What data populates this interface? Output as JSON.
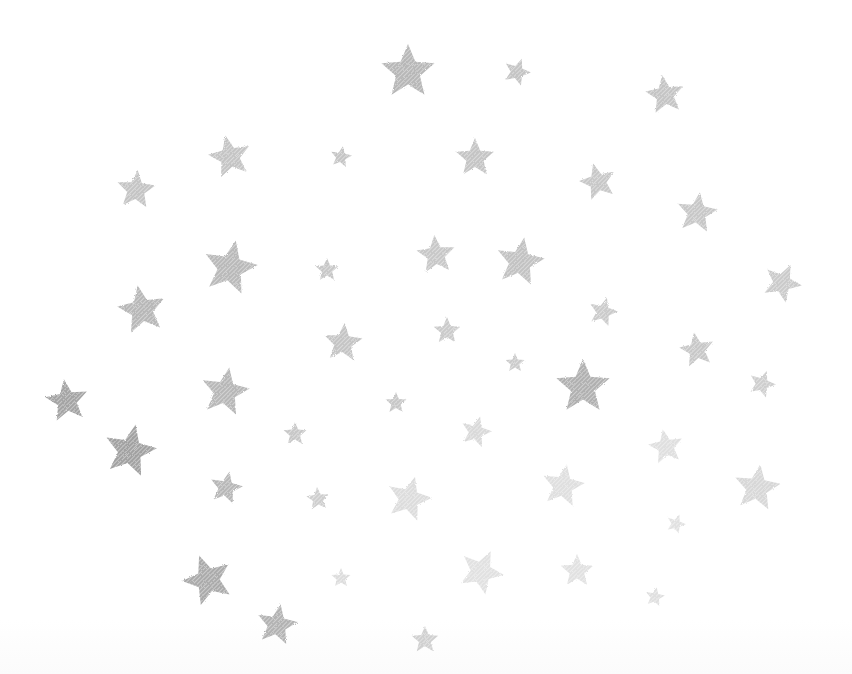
{
  "scene": {
    "description": "Scattered textured gray stars on a white background",
    "background_color": "#ffffff",
    "star_color": "#8a8a8a",
    "width": 852,
    "height": 674
  },
  "stars": [
    {
      "x": 408,
      "y": 72,
      "r": 28,
      "rot": 0,
      "opacity": 0.62
    },
    {
      "x": 517,
      "y": 72,
      "r": 14,
      "rot": 20,
      "opacity": 0.5
    },
    {
      "x": 665,
      "y": 95,
      "r": 20,
      "rot": -8,
      "opacity": 0.5
    },
    {
      "x": 230,
      "y": 157,
      "r": 22,
      "rot": -12,
      "opacity": 0.5
    },
    {
      "x": 341,
      "y": 157,
      "r": 11,
      "rot": 10,
      "opacity": 0.5
    },
    {
      "x": 475,
      "y": 158,
      "r": 20,
      "rot": 0,
      "opacity": 0.5
    },
    {
      "x": 136,
      "y": 190,
      "r": 20,
      "rot": 5,
      "opacity": 0.5
    },
    {
      "x": 598,
      "y": 182,
      "r": 19,
      "rot": -15,
      "opacity": 0.48
    },
    {
      "x": 697,
      "y": 213,
      "r": 21,
      "rot": 8,
      "opacity": 0.48
    },
    {
      "x": 230,
      "y": 268,
      "r": 28,
      "rot": 12,
      "opacity": 0.6
    },
    {
      "x": 327,
      "y": 270,
      "r": 12,
      "rot": 0,
      "opacity": 0.48
    },
    {
      "x": 436,
      "y": 255,
      "r": 20,
      "rot": -5,
      "opacity": 0.48
    },
    {
      "x": 520,
      "y": 262,
      "r": 25,
      "rot": 10,
      "opacity": 0.52
    },
    {
      "x": 782,
      "y": 283,
      "r": 20,
      "rot": 25,
      "opacity": 0.45
    },
    {
      "x": 142,
      "y": 310,
      "r": 25,
      "rot": -10,
      "opacity": 0.62
    },
    {
      "x": 603,
      "y": 312,
      "r": 15,
      "rot": 15,
      "opacity": 0.45
    },
    {
      "x": 343,
      "y": 343,
      "r": 20,
      "rot": 5,
      "opacity": 0.5
    },
    {
      "x": 447,
      "y": 331,
      "r": 14,
      "rot": 0,
      "opacity": 0.45
    },
    {
      "x": 697,
      "y": 350,
      "r": 18,
      "rot": -10,
      "opacity": 0.48
    },
    {
      "x": 515,
      "y": 363,
      "r": 10,
      "rot": 0,
      "opacity": 0.45
    },
    {
      "x": 67,
      "y": 401,
      "r": 22,
      "rot": -8,
      "opacity": 0.78
    },
    {
      "x": 225,
      "y": 392,
      "r": 25,
      "rot": 10,
      "opacity": 0.62
    },
    {
      "x": 583,
      "y": 387,
      "r": 28,
      "rot": 0,
      "opacity": 0.68
    },
    {
      "x": 762,
      "y": 384,
      "r": 14,
      "rot": 20,
      "opacity": 0.42
    },
    {
      "x": 396,
      "y": 403,
      "r": 11,
      "rot": 0,
      "opacity": 0.48
    },
    {
      "x": 130,
      "y": 451,
      "r": 27,
      "rot": 12,
      "opacity": 0.8
    },
    {
      "x": 295,
      "y": 434,
      "r": 12,
      "rot": 0,
      "opacity": 0.48
    },
    {
      "x": 476,
      "y": 432,
      "r": 16,
      "rot": 15,
      "opacity": 0.32
    },
    {
      "x": 666,
      "y": 447,
      "r": 18,
      "rot": -10,
      "opacity": 0.28
    },
    {
      "x": 226,
      "y": 488,
      "r": 17,
      "rot": 12,
      "opacity": 0.62
    },
    {
      "x": 318,
      "y": 499,
      "r": 12,
      "rot": -5,
      "opacity": 0.42
    },
    {
      "x": 409,
      "y": 499,
      "r": 23,
      "rot": 15,
      "opacity": 0.3
    },
    {
      "x": 563,
      "y": 486,
      "r": 22,
      "rot": 10,
      "opacity": 0.28
    },
    {
      "x": 757,
      "y": 488,
      "r": 24,
      "rot": 8,
      "opacity": 0.34
    },
    {
      "x": 676,
      "y": 524,
      "r": 10,
      "rot": 20,
      "opacity": 0.25
    },
    {
      "x": 208,
      "y": 580,
      "r": 26,
      "rot": -20,
      "opacity": 0.72
    },
    {
      "x": 341,
      "y": 578,
      "r": 10,
      "rot": 0,
      "opacity": 0.3
    },
    {
      "x": 481,
      "y": 572,
      "r": 23,
      "rot": 25,
      "opacity": 0.26
    },
    {
      "x": 577,
      "y": 571,
      "r": 17,
      "rot": 0,
      "opacity": 0.26
    },
    {
      "x": 655,
      "y": 597,
      "r": 10,
      "rot": 10,
      "opacity": 0.28
    },
    {
      "x": 277,
      "y": 625,
      "r": 21,
      "rot": 10,
      "opacity": 0.66
    },
    {
      "x": 425,
      "y": 640,
      "r": 14,
      "rot": 0,
      "opacity": 0.4
    }
  ]
}
